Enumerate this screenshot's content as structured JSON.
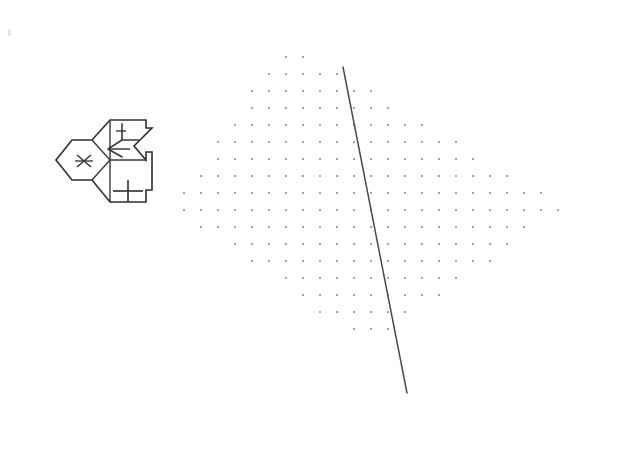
{
  "figure": {
    "background_color": "#ffffff",
    "width": 619,
    "height": 452
  },
  "corner_artifact": {
    "name": "faint-corner-mark",
    "x": 8,
    "y": 30,
    "color": "#e2e2e2"
  },
  "arrow_glyph": {
    "label": "branching-arrow",
    "stroke_color": "#2f2f2f",
    "fill_color": "#ffffff",
    "stroke_width": 1.6,
    "description": "Forked arrow outline with two arrowheads pointing to upper-right and lower-right, subdivided into four cells",
    "outline_points": "110,120 146,120 146,128 152,128 134,146 146,160 146,152 152,152 152,190 146,190 146,202 110,202 92,180 72,180 56,160 72,140 92,140",
    "cells": [
      {
        "name": "left-cell",
        "symbol": "x-mark",
        "cx": 84,
        "cy": 161
      },
      {
        "name": "middle-cell",
        "symbol": "chevron-left",
        "cx": 110,
        "cy": 148
      },
      {
        "name": "upper-right-cell",
        "symbol": "corner-l-mark",
        "cx": 130,
        "cy": 132
      },
      {
        "name": "lower-right-cell",
        "symbol": "plus-mark",
        "cx": 128,
        "cy": 191
      }
    ]
  },
  "dot_field": {
    "label": "rhombic dotted area",
    "dot_color": "#8d8d97",
    "dot_radius": 1.1,
    "spacing_x": 17,
    "spacing_y": 17,
    "vertices": {
      "top": {
        "x": 286,
        "y": 40
      },
      "right": {
        "x": 570,
        "y": 206
      },
      "bottom": {
        "x": 368,
        "y": 346
      },
      "left": {
        "x": 170,
        "y": 206
      }
    }
  },
  "transect_line": {
    "label": "diagonal transect",
    "stroke_color": "#4a4a4a",
    "stroke_width": 1.5,
    "x1": 343,
    "y1": 67,
    "x2": 407,
    "y2": 393
  }
}
